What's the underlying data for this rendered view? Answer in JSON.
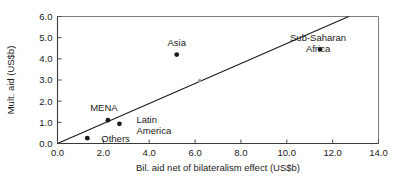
{
  "chart_data": {
    "type": "scatter",
    "title": "",
    "xlabel": "Bil. aid net of bilateralism effect (US$b)",
    "ylabel": "Mult. aid (US$b)",
    "xlim": [
      0.0,
      14.0
    ],
    "ylim": [
      0.0,
      6.0
    ],
    "xticks": [
      "0.0",
      "2.0",
      "4.0",
      "6.0",
      "8.0",
      "10.0",
      "12.0",
      "14.0"
    ],
    "xtick_values": [
      0.0,
      2.0,
      4.0,
      6.0,
      8.0,
      10.0,
      12.0,
      14.0
    ],
    "yticks": [
      "0.0",
      "1.0",
      "2.0",
      "3.0",
      "4.0",
      "5.0",
      "6.0"
    ],
    "ytick_values": [
      0.0,
      1.0,
      2.0,
      3.0,
      4.0,
      5.0,
      6.0
    ],
    "grid": false,
    "legend": "none",
    "points": [
      {
        "label": "Others",
        "x": 1.3,
        "y": 0.25,
        "label_dx": 14,
        "label_dy": 4,
        "anchor": "start",
        "faint": false
      },
      {
        "label": "MENA",
        "x": 2.2,
        "y": 1.1,
        "label_dx": -4,
        "label_dy": -9,
        "anchor": "middle",
        "faint": false
      },
      {
        "label": "Latin\nAmerica",
        "x": 2.7,
        "y": 0.93,
        "label_dx": 17,
        "label_dy": -1,
        "anchor": "start",
        "faint": false
      },
      {
        "label": "Asia",
        "x": 5.2,
        "y": 4.2,
        "label_dx": 0,
        "label_dy": -9,
        "anchor": "middle",
        "faint": false
      },
      {
        "label": "",
        "x": 6.2,
        "y": 2.98,
        "label_dx": 0,
        "label_dy": 0,
        "anchor": "middle",
        "faint": true
      },
      {
        "label": "Sub-Saharan\nAfrica",
        "x": 11.45,
        "y": 4.45,
        "label_dx": -2,
        "label_dy": -8,
        "anchor": "middle",
        "faint": false
      }
    ],
    "trend_line": {
      "x0": 0.0,
      "y0": 0.0,
      "x1": 12.7,
      "y1": 6.0
    },
    "annotations": [
      "Asia",
      "MENA",
      "Latin America",
      "Others",
      "Sub-Saharan Africa"
    ],
    "colors": {
      "marker": "#1a1a1a",
      "marker_faint": "#9a9a9a",
      "axis": "#3a3a3a",
      "frame": "#7d7d7d",
      "trend": "#1a1a1a",
      "text": "#1a1a1a",
      "background": "#ffffff"
    }
  }
}
